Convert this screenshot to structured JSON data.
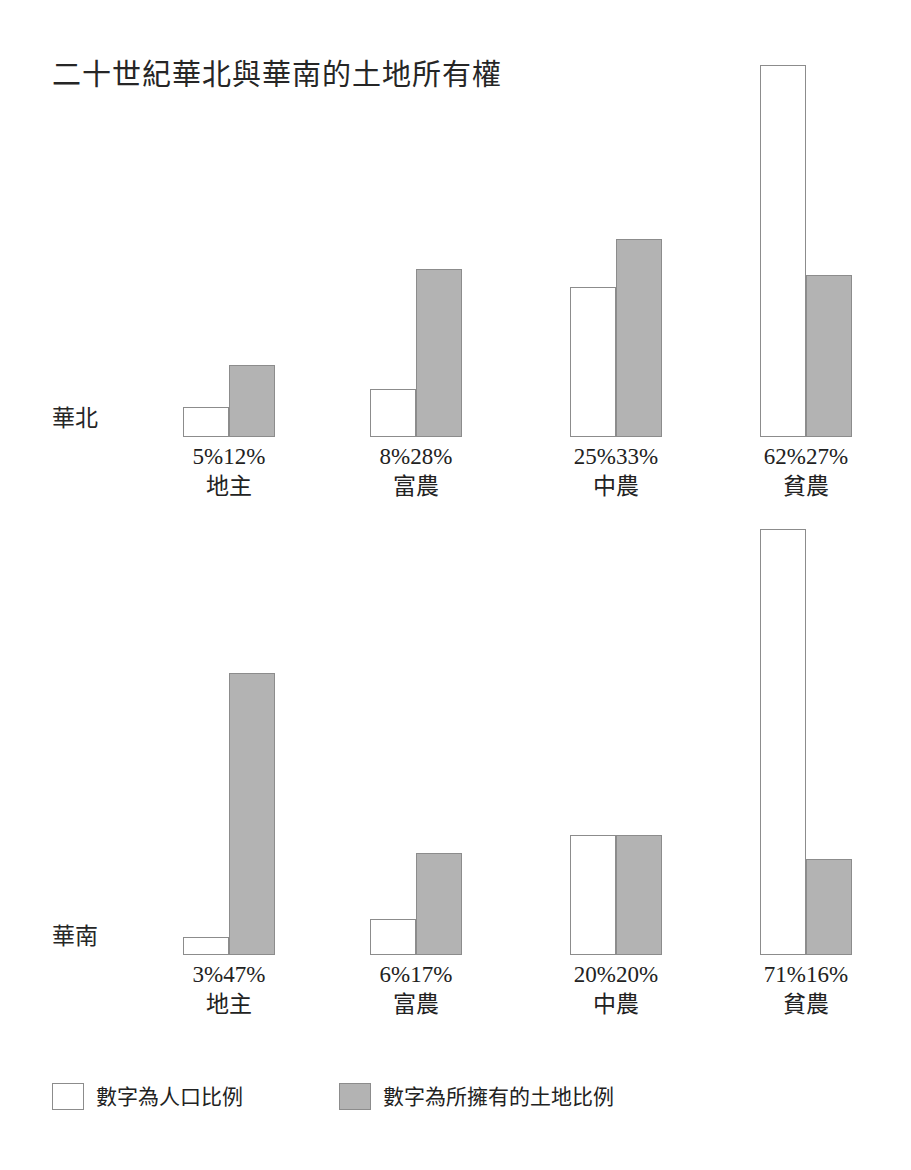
{
  "title": "二十世紀華北與華南的土地所有權",
  "legend": {
    "items": [
      {
        "key": "population",
        "label": "數字為人口比例",
        "color": "#ffffff"
      },
      {
        "key": "land",
        "label": "數字為所擁有的土地比例",
        "color": "#b3b3b3"
      }
    ]
  },
  "panels": [
    {
      "region_label": "華北",
      "groups": [
        {
          "name": "地主",
          "pop_label": "5%",
          "land_label": "12%",
          "pop": 5,
          "land": 12
        },
        {
          "name": "富農",
          "pop_label": "8%",
          "land_label": "28%",
          "pop": 8,
          "land": 28
        },
        {
          "name": "中農",
          "pop_label": "25%",
          "land_label": "33%",
          "pop": 25,
          "land": 33
        },
        {
          "name": "貧農",
          "pop_label": "62%",
          "land_label": "27%",
          "pop": 62,
          "land": 27
        }
      ]
    },
    {
      "region_label": "華南",
      "groups": [
        {
          "name": "地主",
          "pop_label": "3%",
          "land_label": "47%",
          "pop": 3,
          "land": 47
        },
        {
          "name": "富農",
          "pop_label": "6%",
          "land_label": "17%",
          "pop": 6,
          "land": 17
        },
        {
          "name": "中農",
          "pop_label": "20%",
          "land_label": "20%",
          "pop": 20,
          "land": 20
        },
        {
          "name": "貧農",
          "pop_label": "71%",
          "land_label": "16%",
          "pop": 71,
          "land": 16
        }
      ]
    }
  ],
  "chart_data": {
    "type": "bar",
    "title": "二十世紀華北與華南的土地所有權",
    "xlabel": "",
    "ylabel": "",
    "ylim": [
      0,
      75
    ],
    "grid": false,
    "legend_position": "bottom-left",
    "unit": "%",
    "panels": [
      {
        "name": "華北",
        "categories": [
          "地主",
          "富農",
          "中農",
          "貧農"
        ],
        "series": [
          {
            "name": "數字為人口比例",
            "values": [
              5,
              8,
              25,
              62
            ]
          },
          {
            "name": "數字為所擁有的土地比例",
            "values": [
              12,
              28,
              33,
              27
            ]
          }
        ]
      },
      {
        "name": "華南",
        "categories": [
          "地主",
          "富農",
          "中農",
          "貧農"
        ],
        "series": [
          {
            "name": "數字為人口比例",
            "values": [
              3,
              6,
              20,
              71
            ]
          },
          {
            "name": "數字為所擁有的土地比例",
            "values": [
              47,
              17,
              20,
              16
            ]
          }
        ]
      }
    ]
  }
}
